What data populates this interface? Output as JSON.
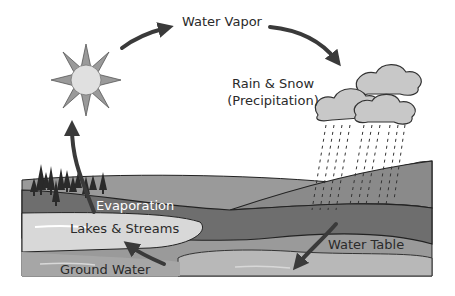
{
  "diagram": {
    "labels": {
      "water_vapor": "Water Vapor",
      "precipitation_line1": "Rain & Snow",
      "precipitation_line2": "(Precipitation)",
      "evaporation": "Evaporation",
      "lakes_streams": "Lakes & Streams",
      "water_table": "Water Table",
      "ground_water": "Ground Water"
    },
    "colors": {
      "sun_core": "#e0e0e0",
      "sun_rays": "#9a9a9a",
      "cloud": "#c8c8c8",
      "arrow": "#3a3a3a",
      "land_top": "#8e8e8e",
      "land_mid": "#6e6e6e",
      "lake": "#dcdcdc",
      "ground_water": "#a8a8a8",
      "trees": "#2a2a2a"
    }
  }
}
